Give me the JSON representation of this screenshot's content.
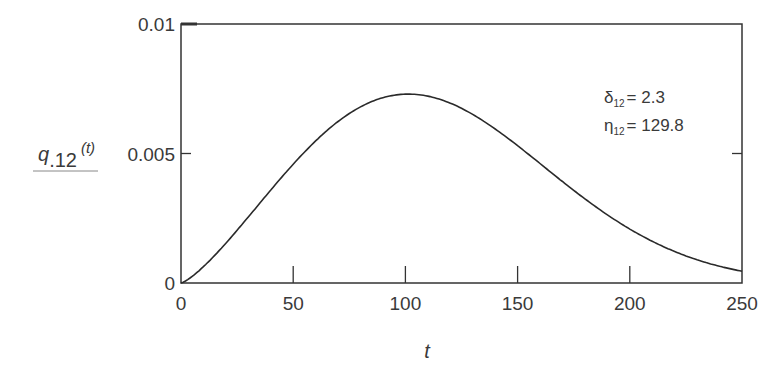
{
  "chart_data": {
    "type": "line",
    "title": "",
    "xlabel": "t",
    "ylabel": "q.12 (t)",
    "ylabel_parts": {
      "main": "q",
      "subscript": ".12",
      "arg": "(t)"
    },
    "xlim": [
      0,
      250
    ],
    "ylim": [
      0,
      0.01
    ],
    "x_ticks": [
      "0",
      "50",
      "100",
      "150",
      "200",
      "250"
    ],
    "y_ticks": [
      "0",
      "0.005",
      "0.01"
    ],
    "grid": false,
    "legend": null,
    "annotations": [
      {
        "symbol": "δ",
        "subscript": "12",
        "text": "= 2.3"
      },
      {
        "symbol": "η",
        "subscript": "12",
        "text": "= 129.8"
      }
    ],
    "series": [
      {
        "name": "q.12(t)",
        "distribution": "weibull",
        "shape": 2.3,
        "scale": 129.8,
        "x": [
          0,
          10,
          20,
          30,
          40,
          50,
          60,
          70,
          80,
          90,
          100,
          110,
          120,
          130,
          140,
          150,
          160,
          170,
          180,
          190,
          200,
          210,
          220,
          230,
          240,
          250
        ],
        "values": [
          0,
          0.00077,
          0.0019,
          0.00314,
          0.00436,
          0.00546,
          0.00636,
          0.00699,
          0.00733,
          0.00738,
          0.00718,
          0.00676,
          0.00618,
          0.0055,
          0.00477,
          0.00403,
          0.00333,
          0.00269,
          0.00213,
          0.00165,
          0.00125,
          0.00093,
          0.00068,
          0.00048,
          0.00034,
          0.00023
        ]
      }
    ],
    "peak": {
      "t": 101,
      "value": 0.0074
    }
  }
}
